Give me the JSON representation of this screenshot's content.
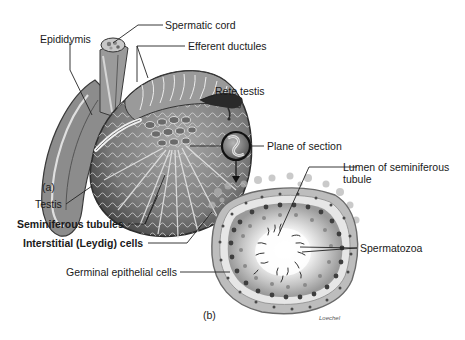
{
  "figure": {
    "panels": [
      {
        "id": "a",
        "label": "(a)",
        "subject": "Testis and epididymis, cut-away view"
      },
      {
        "id": "b",
        "label": "(b)",
        "subject": "Cross section of seminiferous tubule"
      }
    ],
    "labels": {
      "spermatic_cord": "Spermatic cord",
      "epididymis": "Epididymis",
      "efferent_ductules": "Efferent ductules",
      "rete_testis": "Rete testis",
      "plane_of_section": "Plane of section",
      "lumen_line1": "Lumen of seminiferous",
      "lumen_line2": "tubule",
      "testis": "Testis",
      "seminiferous_tubules": "Seminiferous tubules",
      "interstitial_cells": "Interstitial (Leydig) cells",
      "spermatozoa": "Spermatozoa",
      "germinal_epithelial_cells": "Germinal epithelial cells"
    },
    "panel_a_label": "(a)",
    "panel_b_label": "(b)",
    "artist_credit": "Loechel",
    "colors": {
      "background": "#ffffff",
      "ink": "#1a1a1a",
      "tissue_dark": "#4a4a4a",
      "tissue_mid": "#8a8a8a",
      "tissue_light": "#d0d0d0",
      "leader_line": "#222222"
    }
  }
}
